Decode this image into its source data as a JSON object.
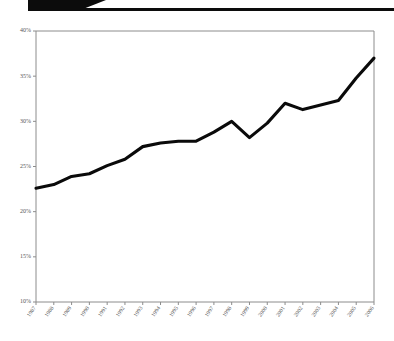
{
  "header": {
    "tab_icon": "black-corner-tab",
    "rule_icon": "horizontal-rule",
    "ghost_text": ""
  },
  "chart_data": {
    "type": "line",
    "title": "",
    "subtitle": "",
    "xlabel": "",
    "ylabel": "",
    "grid": false,
    "legend": false,
    "ylim": [
      10,
      40
    ],
    "ytick_labels": [
      "40%",
      "35%",
      "30%",
      "25%",
      "20%",
      "15%",
      "10%"
    ],
    "ytick_values": [
      40,
      35,
      30,
      25,
      20,
      15,
      10
    ],
    "categories": [
      "1987",
      "1988",
      "1989",
      "1990",
      "1991",
      "1992",
      "1993",
      "1994",
      "1995",
      "1996",
      "1997",
      "1998",
      "1999",
      "2000",
      "2001",
      "2002",
      "2003",
      "2004",
      "2005",
      "2006"
    ],
    "series": [
      {
        "name": "",
        "color": "#0a0a0a",
        "values": [
          22.6,
          23.0,
          23.9,
          24.2,
          25.1,
          25.8,
          27.2,
          27.6,
          27.8,
          27.8,
          28.8,
          30.0,
          28.2,
          29.8,
          32.0,
          31.3,
          31.8,
          32.3,
          34.8,
          37.0
        ]
      }
    ]
  }
}
